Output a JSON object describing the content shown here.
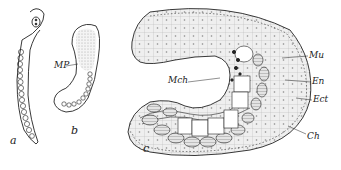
{
  "figure": {
    "panels": [
      {
        "id": "a",
        "label": "a"
      },
      {
        "id": "b",
        "label": "b"
      },
      {
        "id": "c",
        "label": "c"
      }
    ],
    "annotations": {
      "mp": "MP",
      "mch": "Mch",
      "mu": "Mu",
      "en": "En",
      "ect": "Ect",
      "ch": "Ch"
    },
    "colors": {
      "ink": "#222222",
      "stipple": "#cfcfcf",
      "background": "#ffffff"
    }
  }
}
